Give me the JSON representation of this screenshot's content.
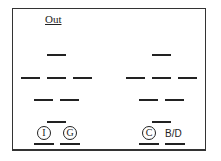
{
  "diagram": {
    "title": "Out",
    "left_group": {
      "labels": [
        "I",
        "G"
      ]
    },
    "right_group": {
      "labels": [
        "C",
        "B/D"
      ]
    }
  }
}
